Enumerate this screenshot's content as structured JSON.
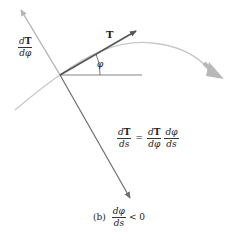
{
  "figure": {
    "labels": {
      "dT_dphi": {
        "num_d": "d",
        "num_T": "T",
        "den": "dφ"
      },
      "T": "T",
      "phi": "φ"
    },
    "equation": {
      "lhs": {
        "num_d": "d",
        "num_T": "T",
        "den": "ds"
      },
      "equals": "=",
      "rhs1": {
        "num_d": "d",
        "num_T": "T",
        "den": "dφ"
      },
      "rhs2": {
        "num": "dφ",
        "den": "ds"
      }
    },
    "caption": {
      "tag": "(b)",
      "frac": {
        "num": "dφ",
        "den": "ds"
      },
      "relation": "< 0"
    },
    "colors": {
      "curve": "#c8c8c8",
      "dT_dphi_vector": "#b4b4b4",
      "normal_vector": "#6e6e6e",
      "T_vector": "#555555",
      "reference_line": "#777777",
      "direction_arrow": "#b8b8b8"
    }
  }
}
